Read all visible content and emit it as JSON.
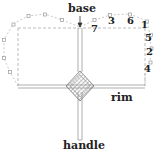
{
  "diagram": {
    "labels": {
      "base": "base",
      "rim": "rim",
      "handle": "handle"
    },
    "numbers": [
      "7",
      "3",
      "6",
      "1",
      "5",
      "2",
      "4"
    ],
    "colors": {
      "line": "#999999",
      "dashed": "#aaaaaa",
      "text": "#222222",
      "diamond_fill": "#bbbbbb"
    }
  }
}
